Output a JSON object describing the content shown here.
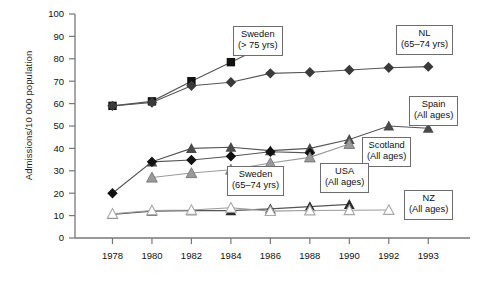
{
  "chart_data": {
    "type": "line",
    "title": "",
    "xlabel": "",
    "ylabel": "Admissions/10 000 population",
    "ylim": [
      0,
      100
    ],
    "yticks": [
      0,
      10,
      20,
      30,
      40,
      50,
      60,
      70,
      80,
      90,
      100
    ],
    "xticks": [
      "1978",
      "1980",
      "1982",
      "1984",
      "1986",
      "1988",
      "1990",
      "1992",
      "1993"
    ],
    "grid": false,
    "legend": "inline-callouts",
    "series": [
      {
        "name": "Sweden (> 75 yrs)",
        "marker": "filled-square",
        "color": "#111111",
        "points": [
          {
            "x": "1978",
            "y": 59
          },
          {
            "x": "1980",
            "y": 61
          },
          {
            "x": "1982",
            "y": 70
          },
          {
            "x": "1984",
            "y": 78.5
          },
          {
            "x": "1986",
            "y": 87
          }
        ]
      },
      {
        "name": "NL (65-74 yrs)",
        "marker": "filled-diamond",
        "color": "#3a3a3a",
        "points": [
          {
            "x": "1978",
            "y": 59
          },
          {
            "x": "1980",
            "y": 60.5
          },
          {
            "x": "1982",
            "y": 68
          },
          {
            "x": "1984",
            "y": 69.5
          },
          {
            "x": "1986",
            "y": 73.5
          },
          {
            "x": "1988",
            "y": 74
          },
          {
            "x": "1990",
            "y": 75
          },
          {
            "x": "1992",
            "y": 76
          },
          {
            "x": "1993",
            "y": 76.5
          }
        ]
      },
      {
        "name": "Spain (All ages)",
        "marker": "filled-triangle",
        "color": "#4a4a4a",
        "points": [
          {
            "x": "1980",
            "y": 34
          },
          {
            "x": "1982",
            "y": 40
          },
          {
            "x": "1984",
            "y": 40.5
          },
          {
            "x": "1986",
            "y": 39
          },
          {
            "x": "1988",
            "y": 40
          },
          {
            "x": "1990",
            "y": 44
          },
          {
            "x": "1992",
            "y": 50
          },
          {
            "x": "1993",
            "y": 49
          }
        ]
      },
      {
        "name": "Sweden (65-74 yrs)",
        "marker": "filled-diamond",
        "color": "#111111",
        "points": [
          {
            "x": "1978",
            "y": 20
          },
          {
            "x": "1980",
            "y": 34
          },
          {
            "x": "1982",
            "y": 34.8
          },
          {
            "x": "1984",
            "y": 36.5
          },
          {
            "x": "1986",
            "y": 38.5
          },
          {
            "x": "1988",
            "y": 38
          }
        ]
      },
      {
        "name": "Scotland (All ages)",
        "marker": "grey-triangle",
        "color": "#9a9a9a",
        "points": [
          {
            "x": "1980",
            "y": 27
          },
          {
            "x": "1982",
            "y": 29
          },
          {
            "x": "1984",
            "y": 30.5
          },
          {
            "x": "1986",
            "y": 33.5
          },
          {
            "x": "1988",
            "y": 36
          },
          {
            "x": "1990",
            "y": 42
          }
        ]
      },
      {
        "name": "USA (All ages)",
        "marker": "filled-triangle",
        "color": "#2b2b2b",
        "points": [
          {
            "x": "1978",
            "y": 10.5
          },
          {
            "x": "1980",
            "y": 12
          },
          {
            "x": "1982",
            "y": 12.2
          },
          {
            "x": "1984",
            "y": 12.2
          },
          {
            "x": "1986",
            "y": 13
          },
          {
            "x": "1988",
            "y": 14
          },
          {
            "x": "1990",
            "y": 15
          }
        ]
      },
      {
        "name": "NZ (All ages)",
        "marker": "open-grey-triangle",
        "color": "#a8a8a8",
        "points": [
          {
            "x": "1978",
            "y": 10.8
          },
          {
            "x": "1980",
            "y": 12.3
          },
          {
            "x": "1982",
            "y": 12.5
          },
          {
            "x": "1984",
            "y": 13.5
          },
          {
            "x": "1986",
            "y": 12
          },
          {
            "x": "1988",
            "y": 12.3
          },
          {
            "x": "1990",
            "y": 12.4
          },
          {
            "x": "1992",
            "y": 12.5
          }
        ]
      }
    ]
  },
  "callouts": {
    "sweden_75": {
      "line1": "Sweden",
      "line2": "(> 75 yrs)"
    },
    "nl": {
      "line1": "NL",
      "line2": "(65–74 yrs)"
    },
    "spain": {
      "line1": "Spain",
      "line2": "(All ages)"
    },
    "scotland": {
      "line1": "Scotland",
      "line2": "(All ages)"
    },
    "sweden_6574": {
      "line1": "Sweden",
      "line2": "(65–74 yrs)"
    },
    "usa": {
      "line1": "USA",
      "line2": "(All ages)"
    },
    "nz": {
      "line1": "NZ",
      "line2": "(All ages)"
    }
  },
  "axes": {
    "ylabel": "Admissions/10 000 population",
    "yticks": [
      "100",
      "90",
      "80",
      "70",
      "60",
      "50",
      "40",
      "30",
      "20",
      "10",
      "0"
    ],
    "xticks": [
      "1978",
      "1980",
      "1982",
      "1984",
      "1986",
      "1988",
      "1990",
      "1992",
      "1993"
    ]
  },
  "colors": {
    "axis": "#777777",
    "text": "#111111",
    "box_border": "#6d6d6d"
  }
}
